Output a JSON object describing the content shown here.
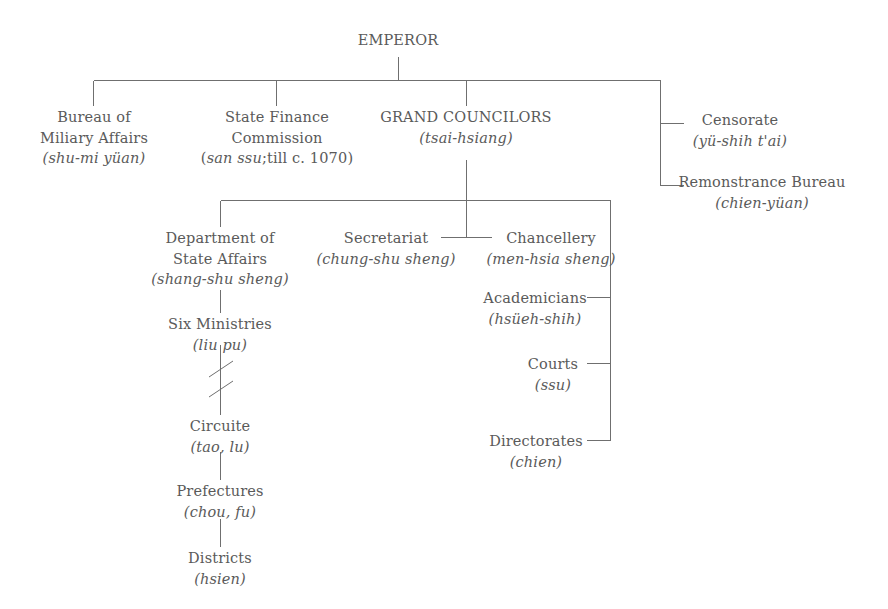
{
  "diagram": {
    "title": "EMPEROR",
    "type": "organization-chart",
    "nodes": {
      "emperor": {
        "label": "EMPEROR",
        "romanization": ""
      },
      "bureau_military": {
        "label_line1": "Bureau of",
        "label_line2": "Miliary Affairs",
        "romanization": "(shu-mi yüan)"
      },
      "state_finance": {
        "label_line1": "State Finance",
        "label_line2": "Commission",
        "romanization_italic": "san ssu",
        "romanization_upright": ";till c. 1070"
      },
      "grand_councilors": {
        "label": "GRAND COUNCILORS",
        "romanization": "(tsai-hsiang)"
      },
      "censorate": {
        "label": "Censorate",
        "romanization": "(yü-shih t'ai)"
      },
      "remonstrance": {
        "label": "Remonstrance Bureau",
        "romanization": "(chien-yüan)"
      },
      "dept_state_affairs": {
        "label_line1": "Department of",
        "label_line2": "State Affairs",
        "romanization": "(shang-shu sheng)"
      },
      "secretariat": {
        "label": "Secretariat",
        "romanization": "(chung-shu sheng)"
      },
      "chancellery": {
        "label": "Chancellery",
        "romanization": "(men-hsia sheng)"
      },
      "academicians": {
        "label": "Academicians",
        "romanization": "(hsüeh-shih)"
      },
      "courts": {
        "label": "Courts",
        "romanization": "(ssu)"
      },
      "directorates": {
        "label": "Directorates",
        "romanization": "(chien)"
      },
      "six_ministries": {
        "label": "Six Ministries",
        "romanization": "(liu pu)"
      },
      "circuite": {
        "label": "Circuite",
        "romanization": "(tao, lu)"
      },
      "prefectures": {
        "label": "Prefectures",
        "romanization": "(chou, fu)"
      },
      "districts": {
        "label": "Districts",
        "romanization": "(hsien)"
      }
    },
    "colors": {
      "line": "#6f6f6f",
      "text": "#5a5a5a",
      "background": "#ffffff"
    }
  }
}
